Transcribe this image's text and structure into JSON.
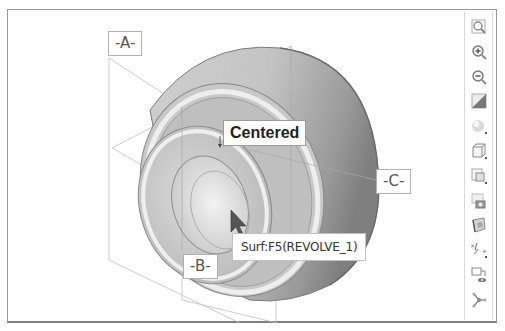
{
  "viewport": {
    "datums": {
      "a": "-A-",
      "b": "-B-",
      "c": "-C-"
    },
    "annotation": "Centered",
    "tooltip": "Surf:F5(REVOLVE_1)"
  },
  "toolbar": {
    "items": [
      {
        "icon": "zoom-fit-icon",
        "label": "Refit"
      },
      {
        "icon": "zoom-in-icon",
        "label": "Zoom In"
      },
      {
        "icon": "zoom-out-icon",
        "label": "Zoom Out"
      },
      {
        "icon": "repaint-icon",
        "label": "Repaint"
      },
      {
        "icon": "display-style-icon",
        "label": "Display Style"
      },
      {
        "icon": "saved-orientations-icon",
        "label": "Saved Orientations"
      },
      {
        "icon": "view-manager-icon",
        "label": "View Manager"
      },
      {
        "icon": "perspective-icon",
        "label": "Perspective View"
      },
      {
        "icon": "section-view-icon",
        "label": "Section"
      },
      {
        "icon": "datum-display-icon",
        "label": "Datum Display Filters"
      },
      {
        "icon": "annotation-display-icon",
        "label": "Annotation Display"
      },
      {
        "icon": "spin-center-icon",
        "label": "Spin Center"
      }
    ]
  },
  "colors": {
    "frame": "#9a9a9a",
    "part_dark": "#8c8c8c",
    "part_light": "#e6e6e6",
    "datum_line": "#b8b8b8"
  }
}
